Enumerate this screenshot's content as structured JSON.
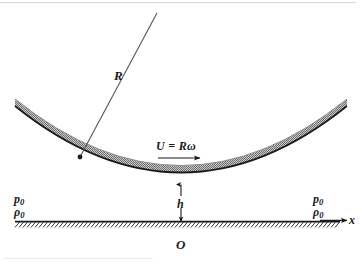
{
  "figure": {
    "type": "physics-schematic",
    "background_color": "#ffffff",
    "ink_color": "#1a1a1a",
    "shell_fill_color": "#a9a9a9"
  },
  "labels": {
    "radius": "R",
    "velocity": "U = Rω",
    "gap": "h",
    "origin": "O",
    "axis_x": "x",
    "pressure_left": "p",
    "pressure_left_sub": "0",
    "density_left": "ρ",
    "density_left_sub": "0",
    "pressure_right": "p",
    "pressure_right_sub": "0",
    "density_right": "ρ",
    "density_right_sub": "0"
  },
  "geometry": {
    "arc_left_x": 15,
    "arc_right_x": 347,
    "arc_end_y": 99,
    "arc_bottom_y": 183,
    "arc_band_thickness": 7,
    "radius_line_start": [
      157,
      13
    ],
    "radius_line_end": [
      80,
      157
    ],
    "radius_dot": [
      80,
      157
    ],
    "velocity_arrow_y": 158,
    "velocity_arrow_x1": 158,
    "velocity_arrow_x2": 200,
    "gap_dimension_x": 181,
    "gap_dimension_y1": 184,
    "gap_dimension_y2": 221,
    "ground_y": 222,
    "ground_x1": 15,
    "ground_x2": 340,
    "axis_arrow_tip_x": 347
  }
}
